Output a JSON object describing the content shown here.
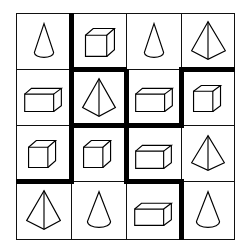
{
  "puzzle": {
    "rows": 4,
    "cols": 4,
    "line_color": "#111111",
    "thick_line_color": "#000000",
    "cells": [
      [
        "cone",
        "cube",
        "cone",
        "pyramid"
      ],
      [
        "box",
        "pyramid",
        "box",
        "cube"
      ],
      [
        "cube",
        "cube",
        "box",
        "pyramid"
      ],
      [
        "pyramid",
        "cone",
        "box",
        "cone"
      ]
    ],
    "thick_borders": [
      {
        "orientation": "vertical",
        "after_col": 1,
        "rows": [
          1,
          2,
          3
        ]
      },
      {
        "orientation": "horizontal",
        "after_row": 1,
        "cols": [
          2,
          4
        ]
      },
      {
        "orientation": "vertical",
        "after_col": 2,
        "rows": [
          2,
          3
        ]
      },
      {
        "orientation": "vertical",
        "after_col": 3,
        "rows": [
          2,
          4
        ]
      },
      {
        "orientation": "horizontal",
        "after_row": 2,
        "cols": [
          2,
          3
        ]
      },
      {
        "orientation": "horizontal",
        "after_row": 3,
        "cols": [
          1,
          3
        ]
      }
    ]
  }
}
